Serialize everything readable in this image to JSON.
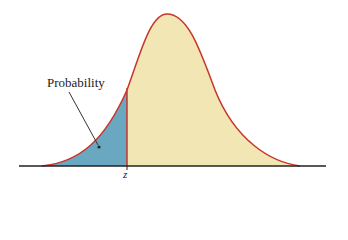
{
  "diagram": {
    "label_probability": "Probability",
    "label_z": "z",
    "colors": {
      "curve": "#c8352a",
      "fill_body": "#f2e6b4",
      "fill_area": "#6aa8c2",
      "axis": "#222222",
      "arrow": "#333333"
    },
    "geometry": {
      "axis_y": 166,
      "axis_x_start": 19,
      "axis_x_end": 326,
      "peak_x": 167,
      "peak_y": 14,
      "z_x": 127
    }
  }
}
